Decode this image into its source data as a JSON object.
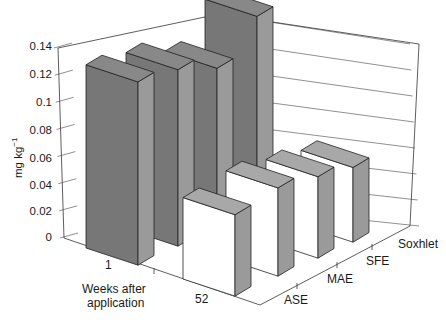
{
  "chart_data": {
    "type": "bar",
    "subtype": "3d-clustered-bar",
    "title": "",
    "ylabel": "mg kg-1",
    "xlabel": "Weeks after application",
    "ylim": [
      0,
      0.14
    ],
    "yticks": [
      "0",
      "0.02",
      "0.04",
      "0.06",
      "0.08",
      "0.1",
      "0.12",
      "0.14"
    ],
    "categories": [
      "1",
      "52"
    ],
    "depth_categories": [
      "ASE",
      "MAE",
      "SFE",
      "Soxhlet"
    ],
    "series": [
      {
        "name": "ASE",
        "values": [
          0.135,
          0.06
        ]
      },
      {
        "name": "MAE",
        "values": [
          0.13,
          0.065
        ]
      },
      {
        "name": "SFE",
        "values": [
          0.12,
          0.06
        ]
      },
      {
        "name": "Soxhlet",
        "values": [
          0.145,
          0.055
        ]
      }
    ],
    "colors": {
      "week_1": "#7a7a7a",
      "week_52": "#ffffff",
      "side": "#9a9a9a",
      "top": "#888888"
    },
    "grid": true
  },
  "labels": {
    "ylabel_main": "mg kg",
    "ylabel_sup": "−1",
    "x_cat_1": "1",
    "x_cat_52": "52",
    "xlabel_line1": "Weeks after",
    "xlabel_line2": "application",
    "depth_ase": "ASE",
    "depth_mae": "MAE",
    "depth_sfe": "SFE",
    "depth_soxhlet": "Soxhlet"
  }
}
